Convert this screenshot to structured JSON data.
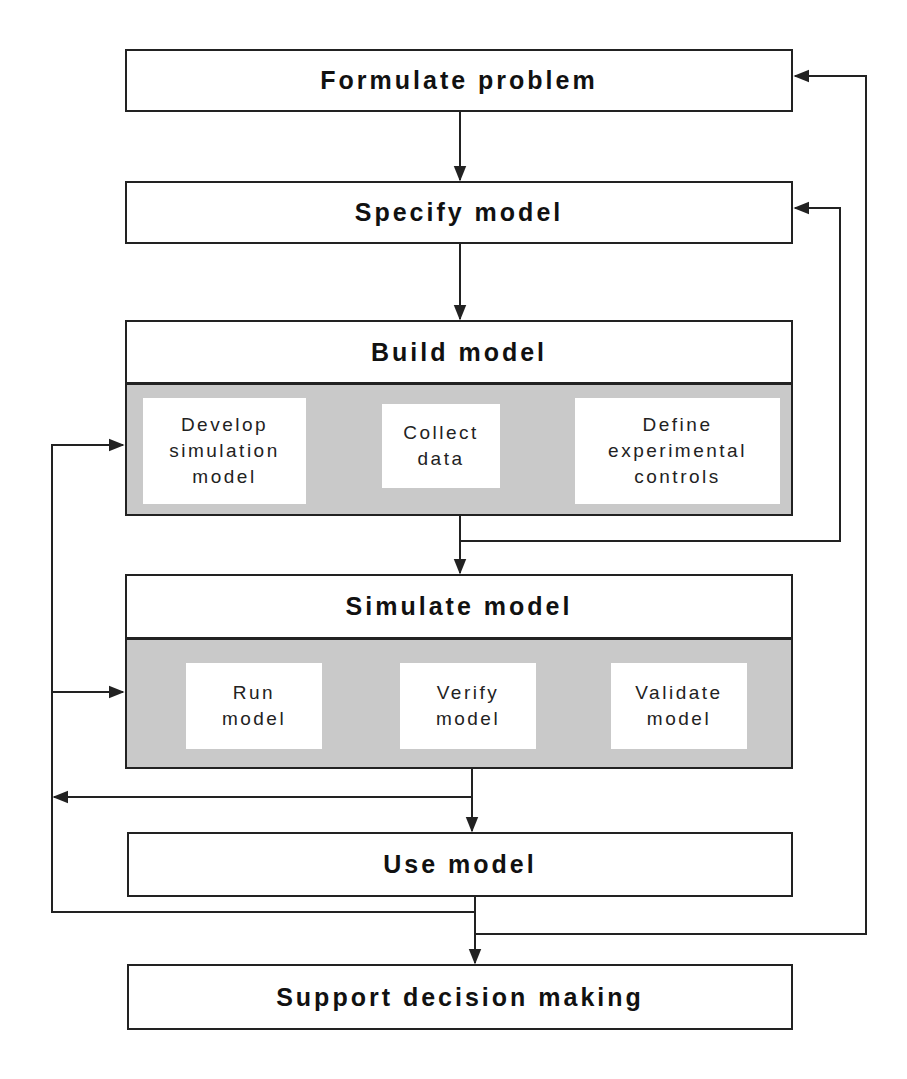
{
  "diagram": {
    "steps": {
      "formulate": "Formulate problem",
      "specify": "Specify model",
      "build": {
        "title": "Build model",
        "substeps": [
          "Develop\nsimulation\nmodel",
          "Collect\ndata",
          "Define\nexperimental\ncontrols"
        ]
      },
      "simulate": {
        "title": "Simulate model",
        "substeps": [
          "Run\nmodel",
          "Verify\nmodel",
          "Validate\nmodel"
        ]
      },
      "use": "Use model",
      "support": "Support decision making"
    },
    "colors": {
      "line": "#222222",
      "panel_fill": "#c9c9c9",
      "box_fill": "#ffffff"
    }
  }
}
